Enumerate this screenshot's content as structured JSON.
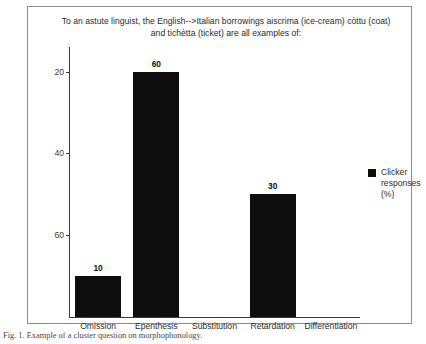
{
  "figure": {
    "caption": "Fig. 1. Example of a cluster question on morphophonology."
  },
  "legend": {
    "label": "Clicker\nresponses\n(%)",
    "swatch_color": "#0d0d0d",
    "position": "right"
  },
  "axis": {
    "y_ticks": [
      "60",
      "40",
      "20"
    ],
    "y_tick_values": [
      60,
      40,
      20
    ]
  },
  "chart_data": {
    "type": "bar",
    "title": "To an astute linguist, the English-->Italian borrowings aiscrima (ice-cream) còttu (coat) and tichètta (ticket) are all examples of:",
    "categories": [
      "Omission",
      "Epenthesis",
      "Substitution",
      "Retardation",
      "Differentiation"
    ],
    "values": [
      10,
      60,
      0,
      30,
      0
    ],
    "data_labels": [
      "10",
      "60",
      "",
      "30",
      ""
    ],
    "series": [
      {
        "name": "Clicker responses (%)",
        "values": [
          10,
          60,
          0,
          30,
          0
        ],
        "color": "#0d0d0d"
      }
    ],
    "xlabel": "",
    "ylabel": "",
    "ylim": [
      0,
      66
    ],
    "yticks": [
      20,
      40,
      60
    ],
    "grid": false,
    "legend_position": "right"
  }
}
